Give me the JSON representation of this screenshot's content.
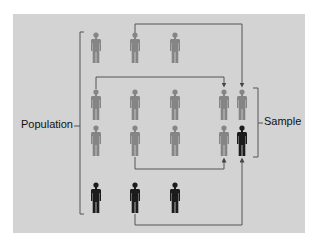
{
  "diagram": {
    "title": "",
    "labels": {
      "population": "Population",
      "sample": "Sample"
    },
    "colors": {
      "background": "#ffffff",
      "panel": "#d3d3d3",
      "figure_unselected": "#858585",
      "figure_selected": "#1c1c1c",
      "line": "#555555"
    },
    "population": {
      "rows": [
        [
          {
            "type": "gray"
          },
          {
            "type": "gray"
          },
          {
            "type": "gray"
          }
        ],
        [
          {
            "type": "gray"
          },
          {
            "type": "gray"
          },
          {
            "type": "gray"
          }
        ],
        [
          {
            "type": "gray"
          },
          {
            "type": "gray"
          },
          {
            "type": "gray"
          }
        ],
        [
          {
            "type": "black"
          },
          {
            "type": "black"
          },
          {
            "type": "black"
          }
        ]
      ]
    },
    "sample": {
      "rows": [
        [
          {
            "type": "gray"
          },
          {
            "type": "gray"
          }
        ],
        [
          {
            "type": "gray"
          },
          {
            "type": "black"
          }
        ]
      ]
    },
    "connections": [
      {
        "from": "population row 1, figure 2",
        "to": "sample row 1, figure 2"
      },
      {
        "from": "population row 2, figure 1",
        "to": "sample row 1, figure 1"
      },
      {
        "from": "population row 3, figure 2",
        "to": "sample row 2, figure 1"
      },
      {
        "from": "population row 4, figure 2",
        "to": "sample row 2, figure 2"
      }
    ]
  }
}
